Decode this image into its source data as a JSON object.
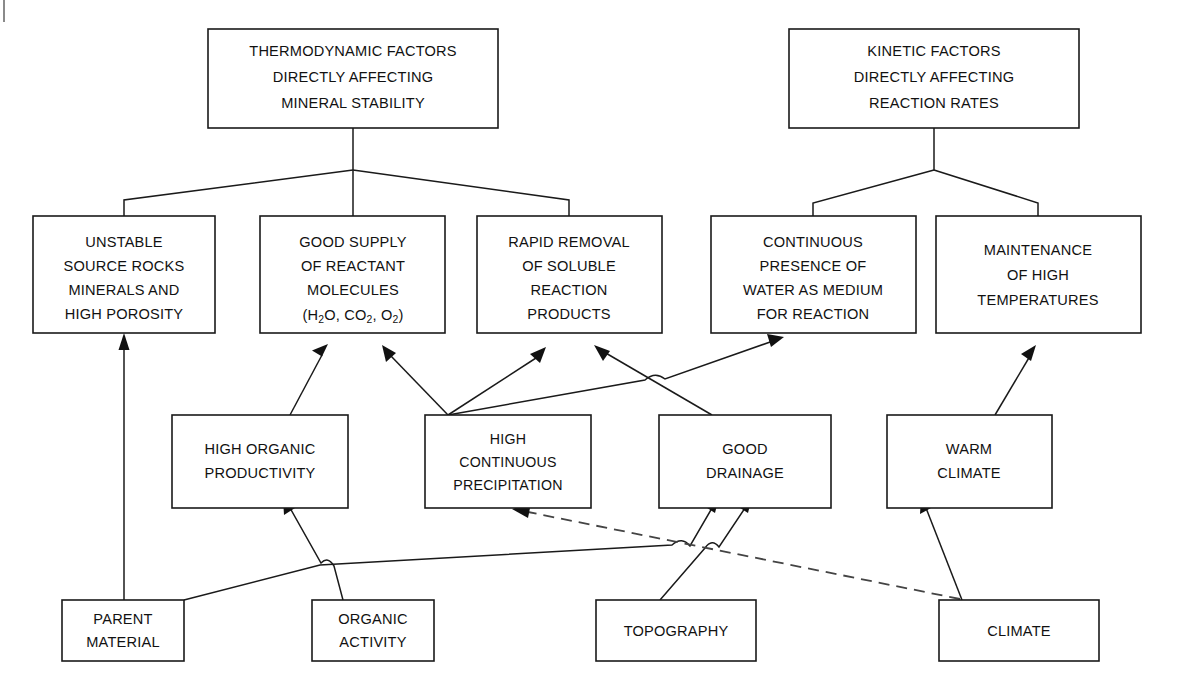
{
  "diagram": {
    "colors": {
      "box_stroke": "#1a1a1a",
      "box_fill": "#ffffff",
      "connector": "#1a1a1a",
      "dashed_connector": "#444444",
      "background": "#ffffff"
    },
    "nodes": [
      {
        "id": "thermodynamic-factors",
        "name": "thermodynamic-factors-box",
        "lines": [
          "THERMODYNAMIC FACTORS",
          "DIRECTLY AFFECTING",
          "MINERAL STABILITY"
        ],
        "x": 208,
        "y": 29,
        "w": 290,
        "h": 99
      },
      {
        "id": "kinetic-factors",
        "name": "kinetic-factors-box",
        "lines": [
          "KINETIC FACTORS",
          "DIRECTLY AFFECTING",
          "REACTION RATES"
        ],
        "x": 789,
        "y": 29,
        "w": 290,
        "h": 99
      },
      {
        "id": "unstable-source-rocks",
        "name": "unstable-source-rocks-box",
        "lines": [
          "UNSTABLE",
          "SOURCE ROCKS",
          "MINERALS AND",
          "HIGH POROSITY"
        ],
        "x": 33,
        "y": 216,
        "w": 182,
        "h": 117
      },
      {
        "id": "good-supply-reactants",
        "name": "good-supply-of-reactant-molecules-box",
        "lines": [
          "GOOD SUPPLY",
          "OF REACTANT",
          "MOLECULES",
          "(H2O, CO2, O2)"
        ],
        "x": 260,
        "y": 216,
        "w": 185,
        "h": 117
      },
      {
        "id": "rapid-removal-products",
        "name": "rapid-removal-of-soluble-reaction-products-box",
        "lines": [
          "RAPID REMOVAL",
          "OF SOLUBLE",
          "REACTION",
          "PRODUCTS"
        ],
        "x": 477,
        "y": 216,
        "w": 185,
        "h": 117
      },
      {
        "id": "continuous-water-presence",
        "name": "continuous-presence-of-water-box",
        "lines": [
          "CONTINUOUS",
          "PRESENCE OF",
          "WATER AS MEDIUM",
          "FOR REACTION"
        ],
        "x": 711,
        "y": 216,
        "w": 205,
        "h": 117
      },
      {
        "id": "high-temperatures",
        "name": "maintenance-of-high-temperatures-box",
        "lines": [
          "MAINTENANCE",
          "OF HIGH",
          "TEMPERATURES"
        ],
        "x": 936,
        "y": 216,
        "w": 205,
        "h": 117
      },
      {
        "id": "high-organic-productivity",
        "name": "high-organic-productivity-box",
        "lines": [
          "HIGH ORGANIC",
          "PRODUCTIVITY"
        ],
        "x": 172,
        "y": 415,
        "w": 176,
        "h": 93
      },
      {
        "id": "high-continuous-precipitation",
        "name": "high-continuous-precipitation-box",
        "lines": [
          "HIGH",
          "CONTINUOUS",
          "PRECIPITATION"
        ],
        "x": 425,
        "y": 415,
        "w": 166,
        "h": 93
      },
      {
        "id": "good-drainage",
        "name": "good-drainage-box",
        "lines": [
          "GOOD",
          "DRAINAGE"
        ],
        "x": 659,
        "y": 415,
        "w": 172,
        "h": 93
      },
      {
        "id": "warm-climate",
        "name": "warm-climate-box",
        "lines": [
          "WARM",
          "CLIMATE"
        ],
        "x": 887,
        "y": 415,
        "w": 165,
        "h": 93
      },
      {
        "id": "parent-material",
        "name": "parent-material-box",
        "lines": [
          "PARENT",
          "MATERIAL"
        ],
        "x": 62,
        "y": 600,
        "w": 122,
        "h": 61
      },
      {
        "id": "organic-activity",
        "name": "organic-activity-box",
        "lines": [
          "ORGANIC",
          "ACTIVITY"
        ],
        "x": 312,
        "y": 600,
        "w": 122,
        "h": 61
      },
      {
        "id": "topography",
        "name": "topography-box",
        "lines": [
          "TOPOGRAPHY"
        ],
        "x": 596,
        "y": 600,
        "w": 160,
        "h": 61
      },
      {
        "id": "climate",
        "name": "climate-box",
        "lines": [
          "CLIMATE"
        ],
        "x": 939,
        "y": 600,
        "w": 160,
        "h": 61
      }
    ],
    "connections": [
      {
        "from": "thermodynamic-factors",
        "to": "unstable-source-rocks",
        "style": "solid",
        "arrow": false
      },
      {
        "from": "thermodynamic-factors",
        "to": "good-supply-reactants",
        "style": "solid",
        "arrow": false
      },
      {
        "from": "thermodynamic-factors",
        "to": "rapid-removal-products",
        "style": "solid",
        "arrow": false
      },
      {
        "from": "kinetic-factors",
        "to": "continuous-water-presence",
        "style": "solid",
        "arrow": false
      },
      {
        "from": "kinetic-factors",
        "to": "high-temperatures",
        "style": "solid",
        "arrow": false
      },
      {
        "from": "parent-material",
        "to": "unstable-source-rocks",
        "style": "solid",
        "arrow": true
      },
      {
        "from": "high-organic-productivity",
        "to": "good-supply-reactants",
        "style": "solid",
        "arrow": true
      },
      {
        "from": "high-continuous-precipitation",
        "to": "good-supply-reactants",
        "style": "solid",
        "arrow": true
      },
      {
        "from": "high-continuous-precipitation",
        "to": "rapid-removal-products",
        "style": "solid",
        "arrow": true
      },
      {
        "from": "high-continuous-precipitation",
        "to": "continuous-water-presence",
        "style": "solid",
        "arrow": true
      },
      {
        "from": "good-drainage",
        "to": "rapid-removal-products",
        "style": "solid",
        "arrow": true
      },
      {
        "from": "warm-climate",
        "to": "high-temperatures",
        "style": "solid",
        "arrow": true
      },
      {
        "from": "organic-activity",
        "to": "high-organic-productivity",
        "style": "solid",
        "arrow": true
      },
      {
        "from": "parent-material",
        "to": "good-drainage",
        "style": "solid",
        "arrow": true
      },
      {
        "from": "topography",
        "to": "good-drainage",
        "style": "solid",
        "arrow": true
      },
      {
        "from": "climate",
        "to": "warm-climate",
        "style": "solid",
        "arrow": true
      },
      {
        "from": "climate",
        "to": "high-continuous-precipitation",
        "style": "dashed",
        "arrow": true
      }
    ]
  }
}
